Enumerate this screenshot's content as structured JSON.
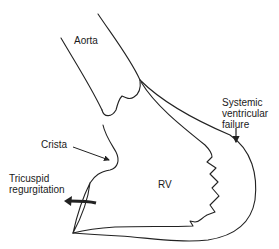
{
  "diagram": {
    "type": "anatomical-line-drawing",
    "labels": {
      "aorta": "Aorta",
      "systemic_line1": "Systemic",
      "systemic_line2": "ventricular",
      "systemic_line3": "failure",
      "crista": "Crista",
      "tricuspid_line1": "Tricuspid",
      "tricuspid_line2": "regurgitation",
      "rv": "RV"
    },
    "colors": {
      "stroke": "#222222",
      "text": "#1a1a1a",
      "background": "#ffffff"
    }
  }
}
